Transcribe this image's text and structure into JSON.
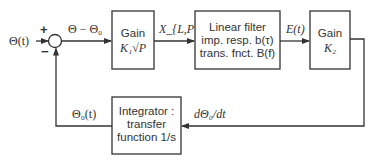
{
  "diagram": {
    "input_label": "Θ(t)",
    "summing_junction": {
      "plus_sign": "+",
      "minus_sign": "−"
    },
    "error_label": "Θ − Θ₀",
    "blocks": [
      {
        "id": "gain1",
        "lines": [
          "Gain",
          "K₁√P"
        ]
      },
      {
        "id": "filter",
        "lines": [
          "Linear filter",
          "imp. resp. b(τ)",
          "trans. fnct. B(f)"
        ]
      },
      {
        "id": "gain2",
        "lines": [
          "Gain",
          "K₂"
        ]
      },
      {
        "id": "integrator",
        "lines": [
          "Integrator :",
          "transfer",
          "function 1/s"
        ]
      }
    ],
    "signals": {
      "gain1_out": "X_{L,P}(t)",
      "filter_out": "E(t)",
      "gain2_out": "dΘ₀/dt",
      "integrator_out": "Θ₀(t)"
    }
  }
}
